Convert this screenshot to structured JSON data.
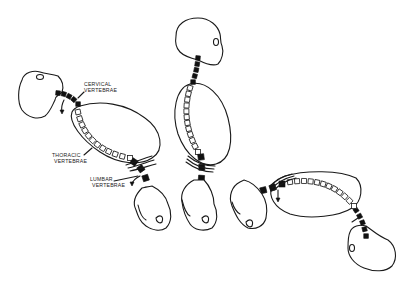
{
  "diagram": {
    "labels": {
      "cervical": [
        "CERVICAL",
        "VERTEBRAE"
      ],
      "thoracic": [
        "THORACIC",
        "VERTEBRAE"
      ],
      "lumbar": [
        "LUMBAR",
        "VERTEBRAE"
      ]
    },
    "figures": [
      {
        "name": "flexed-figure",
        "cervical_count": 5,
        "thoracic_count": 12,
        "lumbar_count": 4
      },
      {
        "name": "upright-figure",
        "cervical_count": 5,
        "thoracic_count": 12,
        "lumbar_count": 4
      },
      {
        "name": "inverted-figure",
        "cervical_count": 5,
        "thoracic_count": 12,
        "lumbar_count": 4
      }
    ],
    "colors": {
      "ink": "#1a1a1a",
      "background": "#ffffff",
      "vertebra_dark": "#111111"
    }
  }
}
